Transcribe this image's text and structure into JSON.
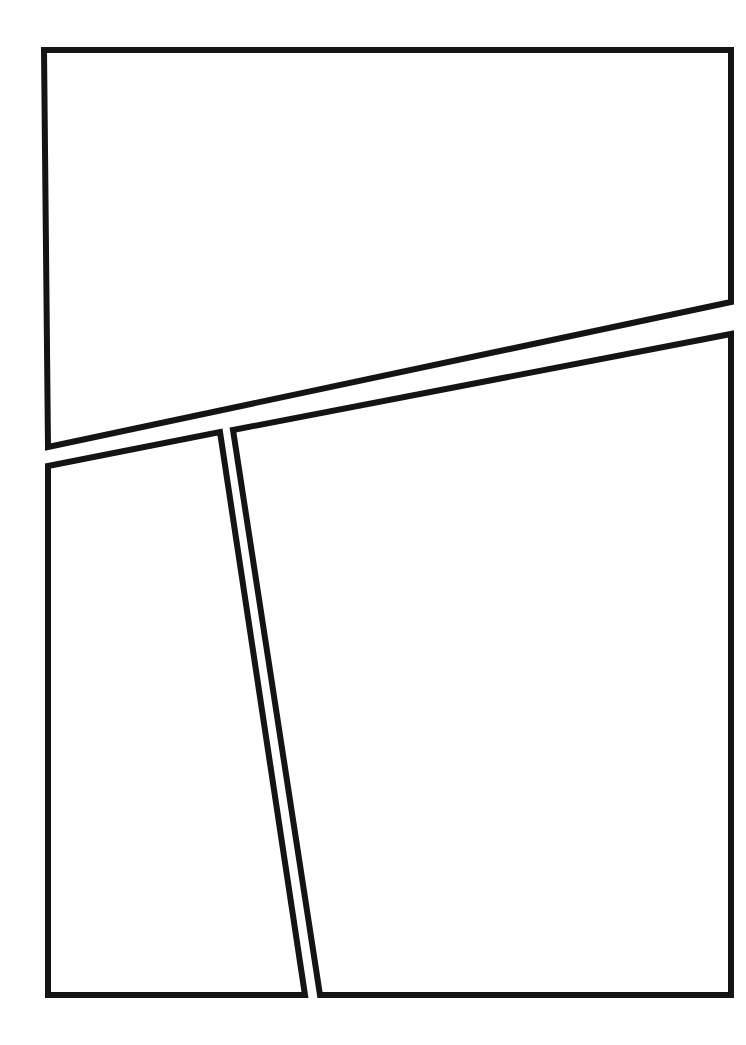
{
  "page": {
    "width": 746,
    "height": 1045,
    "background_color": "#ffffff",
    "ink_color": "#141414",
    "panel_fill_color": "#ffffff",
    "gutter_color": "#ffffff",
    "panel_count": 3,
    "text_content": ""
  },
  "panels": [
    {
      "id": "panel-1",
      "name": "top-panel",
      "label": "",
      "caption": "",
      "content": "",
      "border_width": 6,
      "points": "44,50 731,50 731,302 48,447",
      "description": "Large upper panel, rectangle with a slanted bottom edge rising from left to right."
    },
    {
      "id": "panel-2",
      "name": "bottom-left-panel",
      "label": "",
      "caption": "",
      "content": "",
      "border_width": 6,
      "points": "48,466 220,432 305,995 48,995",
      "description": "Narrow lower-left panel with a slanted top edge and a slanted right edge leaning to the right."
    },
    {
      "id": "panel-3",
      "name": "bottom-right-panel",
      "label": "",
      "caption": "",
      "content": "",
      "border_width": 6,
      "points": "233,430 731,334 731,995 320,995",
      "description": "Large lower-right panel with a slanted top edge and slanted left edge."
    }
  ],
  "gutters": [
    {
      "id": "gutter-horizontal",
      "name": "horizontal-gutter",
      "orientation": "diagonal-horizontal",
      "description": "White gap between the top panel and the two lower panels."
    },
    {
      "id": "gutter-vertical",
      "name": "vertical-gutter",
      "orientation": "diagonal-vertical",
      "description": "White gap between the bottom-left and bottom-right panels."
    }
  ],
  "margins": {
    "left": 44,
    "top": 50,
    "right": 15,
    "bottom": 50
  }
}
